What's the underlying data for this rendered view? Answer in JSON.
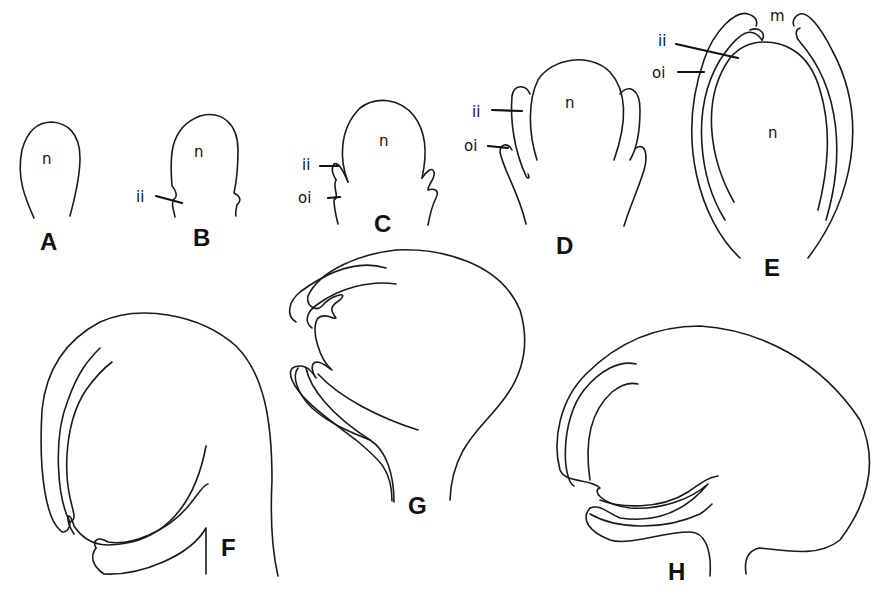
{
  "figure": {
    "panels": [
      {
        "id": "A",
        "labels": [
          "n"
        ]
      },
      {
        "id": "B",
        "labels": [
          "n",
          "ii"
        ]
      },
      {
        "id": "C",
        "labels": [
          "n",
          "ii",
          "oi"
        ]
      },
      {
        "id": "D",
        "labels": [
          "n",
          "ii",
          "oi"
        ]
      },
      {
        "id": "E",
        "labels": [
          "m",
          "ii",
          "oi",
          "n"
        ]
      },
      {
        "id": "F",
        "labels": []
      },
      {
        "id": "G",
        "labels": []
      },
      {
        "id": "H",
        "labels": []
      }
    ],
    "legend_terms": {
      "n": "n",
      "ii": "ii",
      "oi": "oi",
      "m": "m"
    },
    "stroke_color": "#1a1a1a",
    "background": "#ffffff"
  }
}
